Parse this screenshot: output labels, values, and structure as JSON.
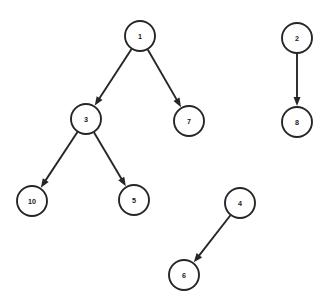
{
  "diagram": {
    "type": "directed-graph",
    "canvas": {
      "width": 329,
      "height": 305,
      "background": "#ffffff"
    },
    "style": {
      "node_fill": "#ffffff",
      "node_stroke": "#262626",
      "node_stroke_width": 1.9,
      "node_radius": 15,
      "label_color": "#1a1a1a",
      "edge_color": "#262626",
      "edge_width": 1.9,
      "arrow_length": 9,
      "arrow_width": 7
    },
    "nodes": [
      {
        "id": "1",
        "label": "1",
        "x": 140,
        "y": 36,
        "r": 15
      },
      {
        "id": "3",
        "label": "3",
        "x": 86,
        "y": 119,
        "r": 15
      },
      {
        "id": "7",
        "label": "7",
        "x": 189,
        "y": 121,
        "r": 15
      },
      {
        "id": "10",
        "label": "10",
        "x": 32,
        "y": 201,
        "r": 15
      },
      {
        "id": "5",
        "label": "5",
        "x": 134,
        "y": 200,
        "r": 15
      },
      {
        "id": "2",
        "label": "2",
        "x": 297,
        "y": 38,
        "r": 15
      },
      {
        "id": "8",
        "label": "8",
        "x": 297,
        "y": 122,
        "r": 15
      },
      {
        "id": "4",
        "label": "4",
        "x": 240,
        "y": 203,
        "r": 15
      },
      {
        "id": "6",
        "label": "6",
        "x": 184,
        "y": 275,
        "r": 15
      }
    ],
    "edges": [
      {
        "from": "1",
        "to": "3",
        "directed": true
      },
      {
        "from": "1",
        "to": "7",
        "directed": true
      },
      {
        "from": "3",
        "to": "10",
        "directed": true
      },
      {
        "from": "3",
        "to": "5",
        "directed": true
      },
      {
        "from": "2",
        "to": "8",
        "directed": true
      },
      {
        "from": "4",
        "to": "6",
        "directed": true
      }
    ]
  }
}
